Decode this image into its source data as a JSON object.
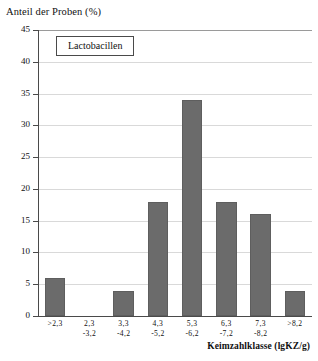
{
  "chart_data": {
    "type": "bar",
    "title": "",
    "ylabel": "Anteil der Proben (%)",
    "xlabel": "Keimzahlklasse (lgKZ/g)",
    "legend": [
      "Lactobacillen"
    ],
    "legend_position": "top-left-inside",
    "grid": true,
    "ylim": [
      0,
      45
    ],
    "yticks": [
      0,
      5,
      10,
      15,
      20,
      25,
      30,
      35,
      40,
      45
    ],
    "ytick_labels": [
      "0",
      "5",
      "10",
      "15",
      "20",
      "25",
      "30",
      "35",
      "40",
      "45"
    ],
    "categories": [
      ">2,3",
      "2,3 -3,2",
      "3,3 -4,2",
      "4,3 -5,2",
      "5,3 -6,2",
      "6,3 -7,2",
      "7,3 -8,2",
      ">8,2"
    ],
    "category_lines": [
      {
        "line1": ">2,3",
        "line2": ""
      },
      {
        "line1": "2,3",
        "line2": "-3,2"
      },
      {
        "line1": "3,3",
        "line2": "-4,2"
      },
      {
        "line1": "4,3",
        "line2": "-5,2"
      },
      {
        "line1": "5,3",
        "line2": "-6,2"
      },
      {
        "line1": "6,3",
        "line2": "-7,2"
      },
      {
        "line1": "7,3",
        "line2": "-8,2"
      },
      {
        "line1": ">8,2",
        "line2": ""
      }
    ],
    "values": [
      6,
      0,
      4,
      18,
      34,
      18,
      16,
      4
    ],
    "series": [
      {
        "name": "Lactobacillen",
        "values": [
          6,
          0,
          4,
          18,
          34,
          18,
          16,
          4
        ]
      }
    ],
    "bar_color": "#6b6b6b",
    "grid_color": "#d9d9d9",
    "axis_color": "#4a4a4a"
  }
}
